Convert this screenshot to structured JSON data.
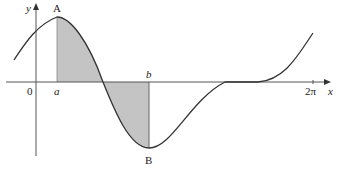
{
  "diagram": {
    "axes": {
      "x_label": "x",
      "y_label": "y",
      "origin_label": "0",
      "x_tick_label": "2π"
    },
    "points": {
      "a_label": "a",
      "b_label": "b",
      "max_label": "A",
      "min_label": "B"
    },
    "colors": {
      "curve": "#333333",
      "axis": "#555555",
      "shade": "#bdbdbd"
    }
  }
}
